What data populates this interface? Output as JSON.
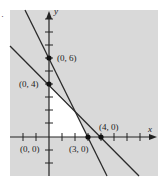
{
  "figure": {
    "marker": "·",
    "colors": {
      "background": "#d9d9d9",
      "feasible_region": "#ffffff",
      "lines": "#2a2a2a",
      "axes": "#222222"
    },
    "axes": {
      "x_label": "x",
      "y_label": "y"
    },
    "points": [
      {
        "label": "(0, 6)",
        "x": 0,
        "y": 6
      },
      {
        "label": "(0, 4)",
        "x": 0,
        "y": 4
      },
      {
        "label": "(0, 0)",
        "x": 0,
        "y": 0
      },
      {
        "label": "(3, 0)",
        "x": 3,
        "y": 0
      },
      {
        "label": "(4, 0)",
        "x": 4,
        "y": 0
      }
    ],
    "lines": [
      {
        "name": "line through (0,6) and (3,0)",
        "equation": "2x + y = 6"
      },
      {
        "name": "line through (0,4) and (4,0)",
        "equation": "x + y = 4"
      }
    ]
  }
}
